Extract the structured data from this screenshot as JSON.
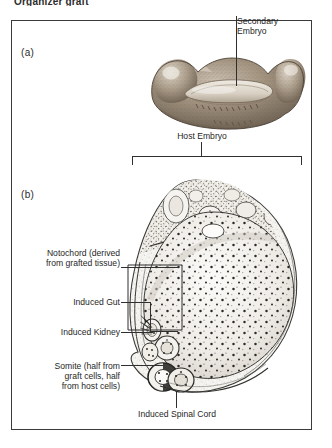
{
  "figure": {
    "top_caption": "Organizer graft",
    "panels": [
      {
        "key": "a",
        "label": "(a)"
      },
      {
        "key": "b",
        "label": "(b)"
      }
    ]
  },
  "annotations": {
    "secondary_embryo": "Secondary\nEmbryo",
    "host_embryo": "Host  Embryo",
    "notochord": "Notochord (derived\nfrom grafted tissue)",
    "induced_gut": "Induced Gut",
    "induced_kidney": "Induced Kidney",
    "somite": "Somite (half from\ngraft cells, half\nfrom host cells)",
    "induced_spinal_cord": "Induced Spinal Cord"
  },
  "colors": {
    "ink": "#2f2f2f",
    "frame": "#3a3a3a",
    "drawing_warm": "#8a7a68",
    "drawing_shadow": "#5d5146",
    "section_ink": "#4a4a4a",
    "paper": "#ffffff"
  }
}
